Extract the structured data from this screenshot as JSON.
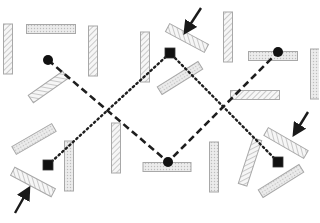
{
  "diagram": {
    "width": 319,
    "height": 223,
    "background": "#ffffff",
    "colors": {
      "bar_stroke": "#a8a8a8",
      "bar_fill": "#f2f2f2",
      "hatch": "#b4b4b4",
      "path": "#1e1e1e",
      "marker": "#111111",
      "arrow": "#1a1a1a"
    },
    "bars": [
      {
        "id": "bar-1",
        "cx": 8,
        "cy": 49,
        "w": 9,
        "h": 50,
        "angle": 0,
        "pattern": "diag"
      },
      {
        "id": "bar-2",
        "cx": 51,
        "cy": 29,
        "w": 49,
        "h": 9,
        "angle": 0,
        "pattern": "dots"
      },
      {
        "id": "bar-3",
        "cx": 93,
        "cy": 51,
        "w": 9,
        "h": 50,
        "angle": 0,
        "pattern": "diag"
      },
      {
        "id": "bar-4",
        "cx": 48,
        "cy": 87,
        "w": 9,
        "h": 42,
        "angle": 55,
        "pattern": "diag"
      },
      {
        "id": "bar-5",
        "cx": 145,
        "cy": 57,
        "w": 9,
        "h": 50,
        "angle": 0,
        "pattern": "diag"
      },
      {
        "id": "bar-6",
        "cx": 187,
        "cy": 38,
        "w": 9,
        "h": 44,
        "angle": -62,
        "pattern": "diag"
      },
      {
        "id": "bar-7",
        "cx": 228,
        "cy": 37,
        "w": 9,
        "h": 50,
        "angle": 0,
        "pattern": "diag"
      },
      {
        "id": "bar-8",
        "cx": 273,
        "cy": 56,
        "w": 49,
        "h": 9,
        "angle": 0,
        "pattern": "dots"
      },
      {
        "id": "bar-9",
        "cx": 315,
        "cy": 74,
        "w": 9,
        "h": 50,
        "angle": 0,
        "pattern": "dots"
      },
      {
        "id": "bar-10",
        "cx": 180,
        "cy": 78,
        "w": 9,
        "h": 48,
        "angle": 58,
        "pattern": "dots"
      },
      {
        "id": "bar-11",
        "cx": 255,
        "cy": 95,
        "w": 49,
        "h": 9,
        "angle": 0,
        "pattern": "diag"
      },
      {
        "id": "bar-12",
        "cx": 34,
        "cy": 139,
        "w": 9,
        "h": 46,
        "angle": 60,
        "pattern": "dots"
      },
      {
        "id": "bar-13",
        "cx": 69,
        "cy": 166,
        "w": 9,
        "h": 50,
        "angle": 0,
        "pattern": "dots"
      },
      {
        "id": "bar-14",
        "cx": 116,
        "cy": 148,
        "w": 9,
        "h": 50,
        "angle": 0,
        "pattern": "diag"
      },
      {
        "id": "bar-15",
        "cx": 33,
        "cy": 182,
        "w": 9,
        "h": 46,
        "angle": -62,
        "pattern": "diag"
      },
      {
        "id": "bar-16",
        "cx": 167,
        "cy": 167,
        "w": 48,
        "h": 9,
        "angle": 0,
        "pattern": "dots"
      },
      {
        "id": "bar-17",
        "cx": 214,
        "cy": 167,
        "w": 9,
        "h": 50,
        "angle": 0,
        "pattern": "dots"
      },
      {
        "id": "bar-18",
        "cx": 250,
        "cy": 162,
        "w": 9,
        "h": 48,
        "angle": 18,
        "pattern": "diag"
      },
      {
        "id": "bar-19",
        "cx": 286,
        "cy": 143,
        "w": 9,
        "h": 46,
        "angle": -60,
        "pattern": "diag"
      },
      {
        "id": "bar-20",
        "cx": 281,
        "cy": 181,
        "w": 9,
        "h": 48,
        "angle": 58,
        "pattern": "dots"
      }
    ],
    "dashed_path": {
      "points": [
        [
          48,
          60
        ],
        [
          168,
          162
        ],
        [
          278,
          52
        ]
      ],
      "dash": "7 4",
      "stroke_width": 2.6
    },
    "dotted_path": {
      "points": [
        [
          48,
          165
        ],
        [
          170,
          53
        ],
        [
          278,
          162
        ]
      ],
      "dash": "1.6 3.2",
      "stroke_width": 2.4
    },
    "circles": [
      {
        "id": "circle-start",
        "cx": 48,
        "cy": 60,
        "r": 5
      },
      {
        "id": "circle-bottom",
        "cx": 168,
        "cy": 162,
        "r": 5
      },
      {
        "id": "circle-end",
        "cx": 278,
        "cy": 52,
        "r": 5
      }
    ],
    "squares": [
      {
        "id": "square-left",
        "cx": 48,
        "cy": 165,
        "size": 10
      },
      {
        "id": "square-top",
        "cx": 170,
        "cy": 53,
        "size": 10
      },
      {
        "id": "square-right",
        "cx": 278,
        "cy": 162,
        "size": 10
      }
    ],
    "arrows": [
      {
        "id": "arrow-top",
        "x1": 201,
        "y1": 8,
        "x2": 186,
        "y2": 31
      },
      {
        "id": "arrow-right",
        "x1": 308,
        "y1": 112,
        "x2": 295,
        "y2": 133
      },
      {
        "id": "arrow-bottom-left",
        "x1": 15,
        "y1": 213,
        "x2": 28,
        "y2": 190
      }
    ]
  }
}
